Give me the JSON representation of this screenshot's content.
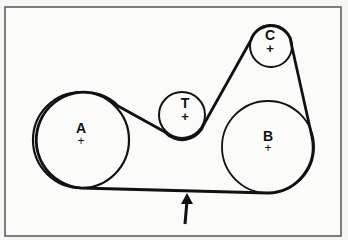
{
  "diagram": {
    "pulleys": [
      {
        "id": "A",
        "label": "A",
        "cx": 81,
        "cy": 140,
        "r": 48
      },
      {
        "id": "T",
        "label": "T",
        "cx": 182,
        "cy": 115,
        "r": 23
      },
      {
        "id": "C",
        "label": "C",
        "cx": 271,
        "cy": 46,
        "r": 21
      },
      {
        "id": "B",
        "label": "B",
        "cx": 268,
        "cy": 147,
        "r": 46
      }
    ],
    "arrow": {
      "label": "",
      "points_to": "belt lower run",
      "x": 186,
      "y_tip": 193,
      "y_tail": 224
    },
    "colors": {
      "line": "#111111",
      "frame": "#555555",
      "background": "#f6f6f4"
    }
  }
}
